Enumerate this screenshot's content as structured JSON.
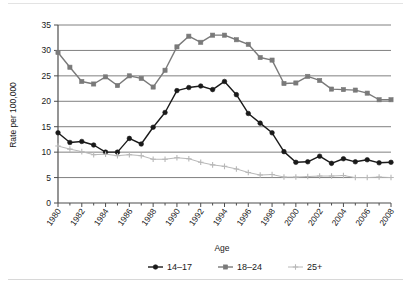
{
  "chart_data": {
    "type": "line",
    "title": "",
    "xlabel": "",
    "ylabel": "Rate per 100,000",
    "legend_title": "Age",
    "legend_position": "bottom",
    "grid": true,
    "xlim": [
      1980,
      2008
    ],
    "ylim": [
      0,
      35
    ],
    "yticks": [
      0,
      5,
      10,
      15,
      20,
      25,
      30,
      35
    ],
    "ytick_labels": [
      "0",
      "5",
      "10",
      "15",
      "20",
      "25",
      "30",
      "35"
    ],
    "x": [
      1980,
      1981,
      1982,
      1983,
      1984,
      1985,
      1986,
      1987,
      1988,
      1989,
      1990,
      1991,
      1992,
      1993,
      1994,
      1995,
      1996,
      1997,
      1998,
      1999,
      2000,
      2001,
      2002,
      2003,
      2004,
      2005,
      2006,
      2007,
      2008
    ],
    "xticks": [
      1980,
      1982,
      1984,
      1986,
      1988,
      1990,
      1992,
      1994,
      1996,
      1998,
      2000,
      2002,
      2004,
      2006,
      2008
    ],
    "xtick_labels": [
      "1980",
      "1982",
      "1984",
      "1986",
      "1988",
      "1990",
      "1992",
      "1994",
      "1996",
      "1998",
      "2000",
      "2002",
      "2004",
      "2006",
      "2008"
    ],
    "series": [
      {
        "name": "14–17",
        "color": "#1a1a1a",
        "marker": "circle",
        "values": [
          13.8,
          11.9,
          12.1,
          11.4,
          10.0,
          10.0,
          12.7,
          11.6,
          14.9,
          17.8,
          22.1,
          22.7,
          23.0,
          22.3,
          23.9,
          21.3,
          17.6,
          15.7,
          13.8,
          10.1,
          8.0,
          8.1,
          9.2,
          7.8,
          8.7,
          8.1,
          8.5,
          7.9,
          8.0
        ]
      },
      {
        "name": "18–24",
        "color": "#7a7a7a",
        "marker": "square",
        "values": [
          29.6,
          26.7,
          23.9,
          23.4,
          24.8,
          23.1,
          25.0,
          24.5,
          22.8,
          26.1,
          30.7,
          32.8,
          31.6,
          33.0,
          33.0,
          32.1,
          31.2,
          28.6,
          28.1,
          23.5,
          23.6,
          24.9,
          24.1,
          22.4,
          22.3,
          22.2,
          21.6,
          20.3,
          20.3
        ]
      },
      {
        "name": "25+",
        "color": "#b8b8b8",
        "marker": "plus",
        "values": [
          11.2,
          10.6,
          10.1,
          9.5,
          9.6,
          9.3,
          9.5,
          9.3,
          8.6,
          8.6,
          8.9,
          8.7,
          8.0,
          7.5,
          7.2,
          6.7,
          6.0,
          5.5,
          5.6,
          5.1,
          5.1,
          5.2,
          5.3,
          5.3,
          5.4,
          5.0,
          5.0,
          5.1,
          5.0
        ]
      }
    ]
  },
  "axis": {
    "ylabel": "Rate per 100,000"
  },
  "legend": {
    "title": "Age",
    "entries": [
      {
        "label": "14–17"
      },
      {
        "label": "18–24"
      },
      {
        "label": "25+"
      }
    ]
  }
}
